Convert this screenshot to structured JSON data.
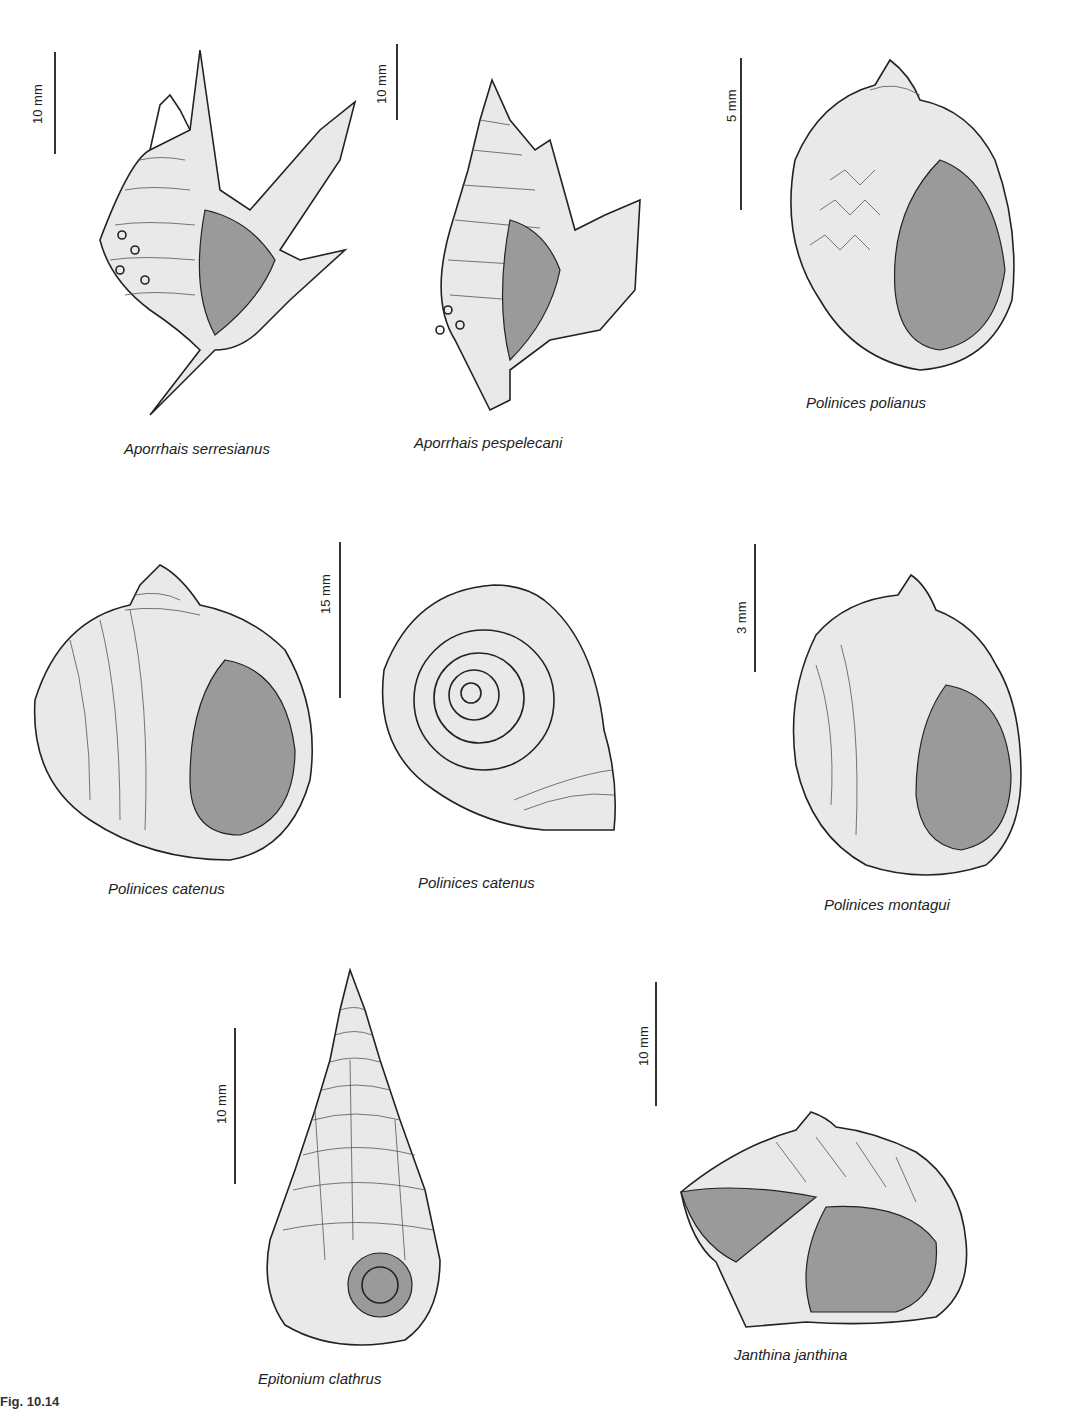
{
  "figure": {
    "label": "Fig. 10.14",
    "ink_color": "#222222",
    "background": "#ffffff"
  },
  "specimens": [
    {
      "name": "Aporrhais serresianus",
      "scale": "10 mm"
    },
    {
      "name": "Aporrhais pespelecani",
      "scale": "10 mm"
    },
    {
      "name": "Polinices polianus",
      "scale": "5 mm"
    },
    {
      "name": "Polinices catenus",
      "scale": "15 mm"
    },
    {
      "name": "Polinices catenus",
      "scale": ""
    },
    {
      "name": "Polinices montagui",
      "scale": "3 mm"
    },
    {
      "name": "Epitonium clathrus",
      "scale": "10 mm"
    },
    {
      "name": "Janthina janthina",
      "scale": "10 mm"
    }
  ],
  "icons": {
    "shell_spider_conch": "aporrhais-shell-icon",
    "shell_moon_snail": "polinices-shell-icon",
    "shell_wentletrap": "epitonium-shell-icon",
    "shell_violet_snail": "janthina-shell-icon"
  }
}
